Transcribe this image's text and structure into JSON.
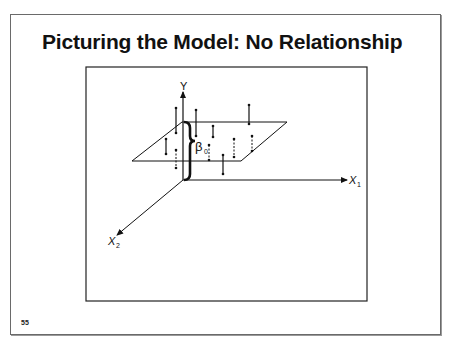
{
  "slide": {
    "title": "Picturing the Model: No Relationship",
    "number": "55"
  },
  "diagram": {
    "axes": {
      "y_label": "Y",
      "x1_label": "X",
      "x1_sub": "1",
      "x2_label": "X",
      "x2_sub": "2"
    },
    "intercept_label": "β",
    "intercept_sub": "0",
    "points": [
      {
        "id": 1,
        "position": "above",
        "style": "solid"
      },
      {
        "id": 2,
        "position": "above",
        "style": "solid"
      },
      {
        "id": 3,
        "position": "above",
        "style": "solid"
      },
      {
        "id": 4,
        "position": "above",
        "style": "solid"
      },
      {
        "id": 5,
        "position": "below",
        "style": "solid"
      },
      {
        "id": 6,
        "position": "below",
        "style": "dashed"
      },
      {
        "id": 7,
        "position": "above",
        "style": "solid"
      },
      {
        "id": 8,
        "position": "below",
        "style": "dashed"
      },
      {
        "id": 9,
        "position": "below",
        "style": "dashed"
      },
      {
        "id": 10,
        "position": "below",
        "style": "dashed"
      },
      {
        "id": 11,
        "position": "below",
        "style": "solid"
      }
    ]
  }
}
